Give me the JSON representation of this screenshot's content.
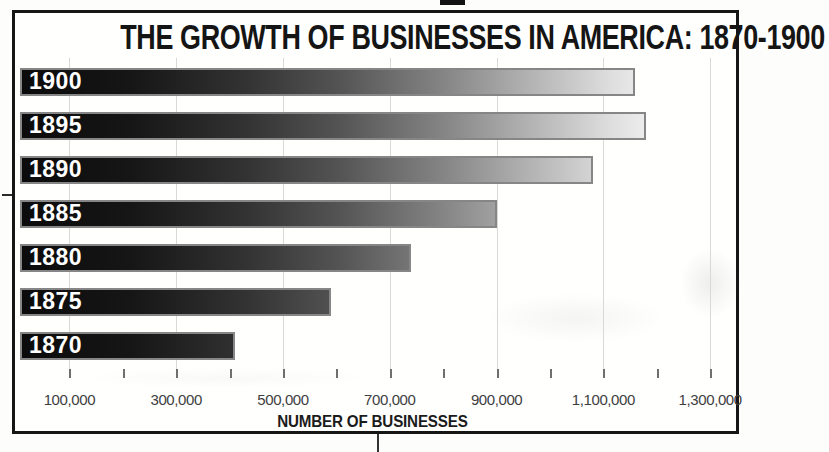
{
  "chart": {
    "title": "THE GROWTH OF BUSINESSES IN AMERICA: 1870-1900",
    "xlabel": "NUMBER OF BUSINESSES"
  },
  "chart_data": {
    "type": "bar",
    "orientation": "horizontal",
    "title": "THE GROWTH OF BUSINESSES IN AMERICA: 1870-1900",
    "xlabel": "NUMBER OF BUSINESSES",
    "categories": [
      "1900",
      "1895",
      "1890",
      "1885",
      "1880",
      "1875",
      "1870"
    ],
    "values": [
      1160000,
      1180000,
      1080000,
      900000,
      740000,
      590000,
      410000
    ],
    "xlim": [
      0,
      1300000
    ],
    "x_tick_labels": [
      "100,000",
      "300,000",
      "500,000",
      "700,000",
      "900,000",
      "1,100,000",
      "1,300,000"
    ],
    "x_tick_values": [
      100000,
      300000,
      500000,
      700000,
      900000,
      1100000,
      1300000
    ],
    "x_minor_tick_step": 100000,
    "grid": true,
    "legend": null,
    "bar_gradient": [
      "#0b0b0b",
      "#f3f3f3"
    ],
    "bar_label_color": "#ffffff"
  },
  "colors": {
    "frame_border": "#161616",
    "bar_border": "#868686",
    "gridline": "#d9d9d9",
    "tick": "#6f6f6f",
    "tick_label_text": "#3e3e3e",
    "title_text": "#151515",
    "axis_title_text": "#1b1b1b",
    "background": "#fdfdfc"
  }
}
